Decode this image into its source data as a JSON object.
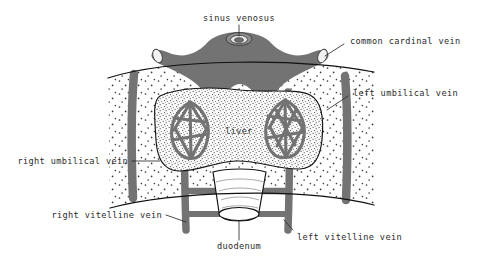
{
  "figure": {
    "background_color": "#ffffff",
    "vessel_color": "#737373",
    "outline_color": "#141414",
    "stipple_color": "#3a3a3a",
    "label_color": "#2b2b2b"
  },
  "labels": {
    "sinus_venosus": "sinus venosus",
    "common_cardinal_vein": "common cardinal vein",
    "left_umbilical_vein": "left umbilical vein",
    "right_umbilical_vein": "right umbilical vein",
    "right_vitelline_vein": "right vitelline vein",
    "left_vitelline_vein": "left vitelline vein",
    "duodenum": "duodenum",
    "liver": "liver"
  },
  "structures": [
    {
      "name": "sinus-venosus",
      "label": "sinus venosus",
      "type": "vessel-opening"
    },
    {
      "name": "common-cardinal-vein",
      "label": "common cardinal vein",
      "type": "vein"
    },
    {
      "name": "left-umbilical-vein",
      "label": "left umbilical vein",
      "type": "vein"
    },
    {
      "name": "right-umbilical-vein",
      "label": "right umbilical vein",
      "type": "vein"
    },
    {
      "name": "left-vitelline-vein",
      "label": "left vitelline vein",
      "type": "vein"
    },
    {
      "name": "right-vitelline-vein",
      "label": "right vitelline vein",
      "type": "vein"
    },
    {
      "name": "liver",
      "label": "liver",
      "type": "organ"
    },
    {
      "name": "duodenum",
      "label": "duodenum",
      "type": "organ"
    }
  ]
}
